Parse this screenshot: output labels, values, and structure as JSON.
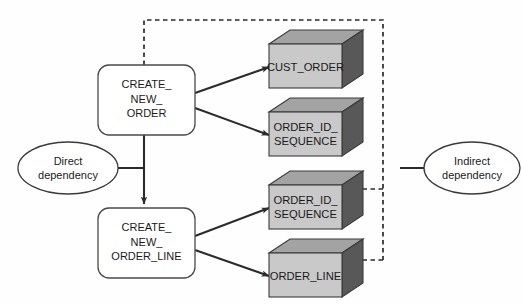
{
  "diagram": {
    "type": "dependency-diagram"
  },
  "colors": {
    "cube_front": "#c9c9c9",
    "cube_top": "#a3a3a3",
    "cube_side": "#585858",
    "cube_stroke": "#3a3a3a",
    "process_fill": "#ffffff",
    "process_stroke": "#4a4a4a",
    "ellipse_fill": "#ffffff",
    "ellipse_stroke": "#3a3a3a",
    "solid_arrow": "#2b2b2b",
    "dashed_arrow": "#2b2b2b",
    "text": "#1a1a1a",
    "background": "#fefefe"
  },
  "processes": [
    {
      "id": "create-new-order",
      "lines": [
        "CREATE_",
        "NEW_",
        "ORDER"
      ]
    },
    {
      "id": "create-new-order-line",
      "lines": [
        "CREATE_",
        "NEW_",
        "ORDER_LINE"
      ]
    }
  ],
  "tables": [
    {
      "id": "cust-order",
      "lines": [
        "CUST_ORDER"
      ]
    },
    {
      "id": "order-id-sequence-1",
      "lines": [
        "ORDER_ID_",
        "SEQUENCE"
      ]
    },
    {
      "id": "order-id-sequence-2",
      "lines": [
        "ORDER_ID_",
        "SEQUENCE"
      ]
    },
    {
      "id": "order-line",
      "lines": [
        "ORDER_LINE"
      ]
    }
  ],
  "legend": [
    {
      "id": "direct-dependency",
      "lines": [
        "Direct",
        "dependency"
      ]
    },
    {
      "id": "indirect-dependency",
      "lines": [
        "Indirect",
        "dependency"
      ]
    }
  ],
  "edges": {
    "solid": [
      {
        "from": "create-new-order",
        "to": "cust-order"
      },
      {
        "from": "create-new-order",
        "to": "order-id-sequence-1"
      },
      {
        "from": "create-new-order",
        "to": "create-new-order-line"
      },
      {
        "from": "create-new-order-line",
        "to": "order-id-sequence-2"
      },
      {
        "from": "create-new-order-line",
        "to": "order-line"
      }
    ],
    "dashed": [
      {
        "from": "create-new-order",
        "to": "order-id-sequence-2"
      },
      {
        "from": "create-new-order",
        "to": "order-line"
      }
    ]
  }
}
